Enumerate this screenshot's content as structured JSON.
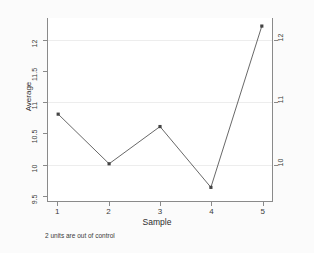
{
  "chart_data": {
    "type": "line",
    "title": "",
    "subtitle": "",
    "xlabel": "Sample",
    "ylabel": "Average",
    "x": [
      1,
      2,
      3,
      4,
      5
    ],
    "categories": [
      "1",
      "2",
      "3",
      "4",
      "5"
    ],
    "values": [
      10.8,
      10.0,
      10.6,
      9.62,
      12.22
    ],
    "series": [
      {
        "name": "Average",
        "values": [
          10.8,
          10.0,
          10.6,
          9.62,
          12.22
        ]
      }
    ],
    "xlim": [
      0.8,
      5.2
    ],
    "ylim": [
      9.4,
      12.35
    ],
    "grid": true,
    "grid_axis": "y",
    "legend": false,
    "legend_position": "none",
    "marker": "filled-square",
    "line_color": "#555555",
    "marker_color": "#444444",
    "grid_color": "#ededed",
    "axis_color": "#8a8a8a",
    "plot_background": "#ffffff",
    "figure_background": "#fbfbfb",
    "left_axis": {
      "ticks": [
        9.5,
        10,
        10.5,
        11,
        11.5,
        12
      ],
      "tick_labels": [
        "9.5",
        "10",
        "10.5",
        "11",
        "11.5",
        "12"
      ],
      "rotated": true
    },
    "right_axis": {
      "ticks": [
        10,
        11,
        12
      ],
      "tick_labels": [
        "10",
        "11",
        "12"
      ],
      "rotated": true
    },
    "x_axis": {
      "ticks": [
        1,
        2,
        3,
        4,
        5
      ],
      "tick_labels": [
        "1",
        "2",
        "3",
        "4",
        "5"
      ]
    },
    "annotations": [
      {
        "name": "out-of-control-note",
        "text": "2 units are out of control",
        "position": "below-axis-left"
      }
    ]
  },
  "caption": {
    "text": "2 units are out of control"
  }
}
